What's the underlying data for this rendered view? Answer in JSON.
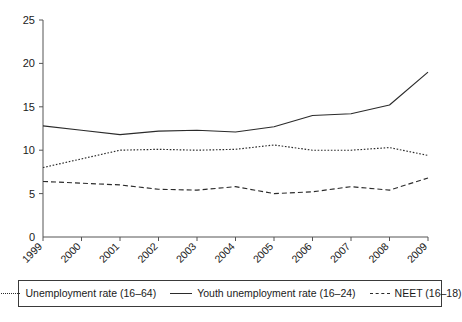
{
  "chart_data": {
    "type": "line",
    "title": "",
    "subtitle": "",
    "xlabel": "",
    "ylabel": "",
    "grid": false,
    "legend_position": "bottom",
    "x": [
      "1999",
      "2000",
      "2001",
      "2002",
      "2003",
      "2004",
      "2005",
      "2006",
      "2007",
      "2008",
      "2009"
    ],
    "categories": [
      "1999",
      "2000",
      "2001",
      "2002",
      "2003",
      "2004",
      "2005",
      "2006",
      "2007",
      "2008",
      "2009"
    ],
    "xlim": [
      "1999",
      "2009"
    ],
    "ylim": [
      0,
      25
    ],
    "yticks": [
      0,
      5,
      10,
      15,
      20,
      25
    ],
    "ytick_labels": [
      "0",
      "5",
      "10",
      "15",
      "20",
      "25"
    ],
    "series": [
      {
        "name": "Unemployment rate (16–64)",
        "style": "dotted",
        "values": [
          8.0,
          9.0,
          10.0,
          10.1,
          10.0,
          10.1,
          10.6,
          10.0,
          10.0,
          10.3,
          9.4
        ]
      },
      {
        "name": "Youth unemployment rate (16–24)",
        "style": "solid",
        "values": [
          12.8,
          12.3,
          11.8,
          12.2,
          12.3,
          12.1,
          12.7,
          14.0,
          14.2,
          15.2,
          19.0
        ]
      },
      {
        "name": "NEET (16–18)",
        "style": "dashed",
        "values": [
          6.4,
          6.2,
          6.0,
          5.5,
          5.4,
          5.8,
          5.0,
          5.2,
          5.8,
          5.4,
          6.8
        ]
      }
    ]
  },
  "legend": {
    "entries": [
      {
        "label": "Unemployment rate (16–64)",
        "style": "dotted"
      },
      {
        "label": "Youth unemployment rate (16–24)",
        "style": "solid"
      },
      {
        "label": "NEET (16–18)",
        "style": "dashed"
      }
    ]
  },
  "colors": {
    "line": "#2b2b2b",
    "axis": "#555555",
    "text": "#1a1a1a",
    "background": "#ffffff"
  }
}
